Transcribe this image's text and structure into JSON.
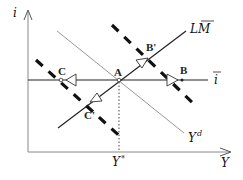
{
  "diagram": {
    "axes": {
      "y_label": "i",
      "x_label": "Y"
    },
    "curves": {
      "lm_label": "LM",
      "lm_bar": true,
      "ibar_label": "i",
      "ibar_bar": true,
      "yd_label": "Y",
      "yd_sup": "d",
      "ystar_label": "Y",
      "ystar_sup": "*"
    },
    "points": {
      "A": "A",
      "B": "B",
      "B_prime": "B'",
      "C": "C",
      "C_prime": "C'"
    },
    "colors": {
      "axis": "#888888",
      "line": "#222222",
      "yd_line": "#999999",
      "dashed": "#111111"
    }
  }
}
